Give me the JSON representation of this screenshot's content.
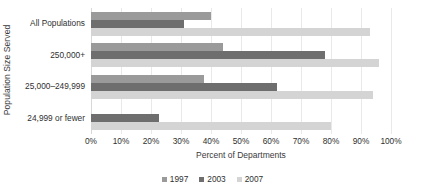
{
  "chart_data": {
    "type": "bar",
    "orientation": "horizontal",
    "title": "",
    "xlabel": "Percent of Departments",
    "ylabel": "Population Size Served",
    "xlim": [
      0,
      100
    ],
    "xtick_labels": [
      "0%",
      "10%",
      "20%",
      "30%",
      "40%",
      "50%",
      "60%",
      "70%",
      "80%",
      "90%",
      "100%"
    ],
    "xtick_values": [
      0,
      10,
      20,
      30,
      40,
      50,
      60,
      70,
      80,
      90,
      100
    ],
    "grid": "vertical",
    "legend_position": "bottom",
    "categories": [
      "All Populations",
      "250,000+",
      "25,000–249,999",
      "24,999 or fewer"
    ],
    "series": [
      {
        "name": "1997",
        "color": "#9a9a9a",
        "values": [
          40,
          44,
          37.5,
          null
        ]
      },
      {
        "name": "2003",
        "color": "#6e6e6e",
        "values": [
          31,
          78,
          62,
          22.5
        ]
      },
      {
        "name": "2007",
        "color": "#d4d4d4",
        "values": [
          93,
          96,
          94,
          80
        ]
      }
    ]
  }
}
